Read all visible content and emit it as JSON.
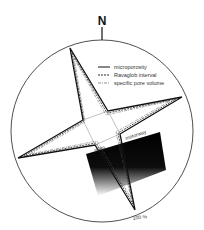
{
  "figure": {
    "north_label": "N",
    "legend": [
      {
        "label": "microporosity",
        "style": "solid"
      },
      {
        "label": "Ravaglob interval",
        "style": "dashed"
      },
      {
        "label": "specific pore volume",
        "style": "dash-dot"
      }
    ],
    "road_labels": {
      "main": "main",
      "motorway": "motorway"
    },
    "scale_label": "100 %",
    "colors": {
      "line": "#111111",
      "block": "#0a0a0a",
      "background": "#ffffff"
    }
  }
}
